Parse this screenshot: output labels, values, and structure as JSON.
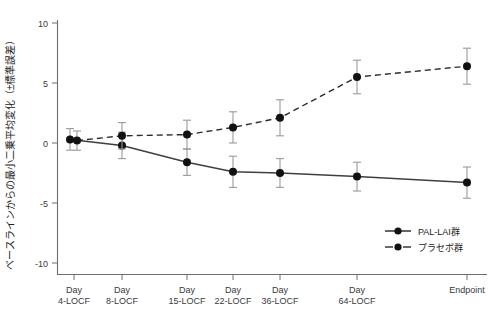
{
  "chart_data": {
    "type": "line",
    "title": "",
    "subtitle": "",
    "xlabel": "",
    "ylabel": "ベースラインからの最小二乗平均変化（±標準誤差）",
    "categories": [
      "Day 4-LOCF",
      "Day 8-LOCF",
      "Day 15-LOCF",
      "Day 22-LOCF",
      "Day 36-LOCF",
      "Day 64-LOCF",
      "Endpoint"
    ],
    "category_lines": [
      [
        "Day",
        "4-LOCF"
      ],
      [
        "Day",
        "8-LOCF"
      ],
      [
        "Day",
        "15-LOCF"
      ],
      [
        "Day",
        "22-LOCF"
      ],
      [
        "Day",
        "36-LOCF"
      ],
      [
        "Day",
        "64-LOCF"
      ],
      [
        "Endpoint",
        ""
      ]
    ],
    "ylim": [
      -10,
      10
    ],
    "yticks": [
      10,
      5,
      0,
      -5,
      -10
    ],
    "ytick_labels": [
      "10",
      "5",
      "0",
      "-5",
      "-10"
    ],
    "grid": false,
    "legend_position": "lower-right",
    "series": [
      {
        "name": "PAL-LAI群",
        "style": "solid",
        "marker": "filled-circle",
        "color": "#111111",
        "values": [
          0.3,
          -0.2,
          -1.6,
          -2.4,
          -2.5,
          -2.8,
          -3.3
        ],
        "errors": [
          0.9,
          1.1,
          1.1,
          1.3,
          1.2,
          1.2,
          1.3
        ]
      },
      {
        "name": "プラセボ群",
        "style": "dashed",
        "marker": "filled-circle",
        "color": "#111111",
        "values": [
          0.2,
          0.6,
          0.7,
          1.3,
          2.1,
          5.5,
          6.4
        ],
        "errors": [
          0.8,
          1.1,
          1.2,
          1.3,
          1.5,
          1.4,
          1.5
        ]
      }
    ]
  },
  "legend": {
    "items": [
      {
        "label": "PAL-LAI群",
        "style": "solid"
      },
      {
        "label": "プラセボ群",
        "style": "dashed"
      }
    ]
  },
  "axes": {
    "y_axis_label": "ベースラインからの最小二乗平均変化（±標準誤差）",
    "y_tick_0": "10",
    "y_tick_1": "5",
    "y_tick_2": "0",
    "y_tick_3": "-5",
    "y_tick_4": "-10"
  }
}
